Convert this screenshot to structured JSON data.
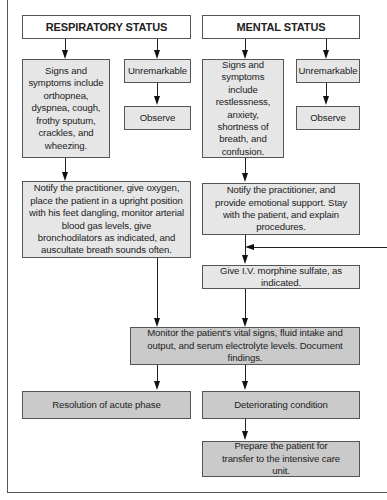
{
  "respiratory": {
    "header": "RESPIRATORY STATUS",
    "signs": "Signs and symptoms include orthopnea, dyspnea, cough, frothy sputum, crackles, and wheezing.",
    "unremarkable": "Unremarkable",
    "observe": "Observe",
    "notify": "Notify the practitioner, give oxygen, place the patient in a upright position with his feet dangling, monitor arterial blood gas levels, give bronchodilators as indicated, and auscultate breath sounds often."
  },
  "mental": {
    "header": "MENTAL STATUS",
    "signs": "Signs and symptoms include restlessness, anxiety, shortness of breath, and confusion.",
    "unremarkable": "Unremarkable",
    "observe": "Observe",
    "notify": "Notify the practitioner, and provide emotional support. Stay with the patient, and explain procedures."
  },
  "shared": {
    "morphine": "Give I.V. morphine sulfate, as indicated.",
    "monitor": "Monitor the patient's vital signs, fluid intake and output, and serum electrolyte levels. Document findings.",
    "resolution": "Resolution of acute phase",
    "deteriorating": "Deteriorating condition",
    "prepare": "Prepare the patient for transfer to the intensive care unit."
  },
  "colors": {
    "header_fill": "#ffffff",
    "step_fill": "#e6e6e6",
    "outcome_fill": "#cacaca",
    "border": "#555555",
    "arrow": "#111111"
  }
}
